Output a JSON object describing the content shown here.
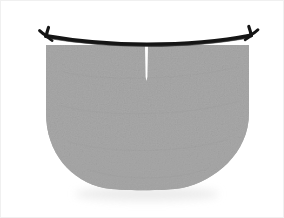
{
  "figure": {
    "title": "Bowl-shaped anatomical structure with dark superior rim",
    "caption": "",
    "canvas": {
      "width": 284,
      "height": 218,
      "background_color": "#ffffff",
      "border_color": "#f0f0f0"
    },
    "colors": {
      "background": "#ffffff",
      "body_fill": "#a8a8a8",
      "body_fill_light": "#b4b4b4",
      "body_fill_dark": "#9c9c9c",
      "rim_stroke": "#151515",
      "slit_fill": "#ffffff",
      "shadow": "#e8e8e8"
    },
    "parts": [
      {
        "id": "body",
        "label": "Bowl-shaped gray body",
        "description": "Large mottled medium-gray region, flat across the top, near-vertical sides, broad rounded U-curve at the bottom",
        "fill": "#a8a8a8",
        "bounds": {
          "left": 45,
          "top": 43,
          "right": 248,
          "bottom": 188
        }
      },
      {
        "id": "rim",
        "label": "Dark superior rim",
        "description": "Thick near-black curved band spanning the top edge, dipping slightly at center and rising toward both ends",
        "stroke": "#151515",
        "thickness": 4,
        "span": {
          "x_start": 42,
          "x_end": 252,
          "y_center": 42,
          "y_ends": 34
        }
      },
      {
        "id": "terminal-left",
        "label": "Left bifurcated terminal hook",
        "description": "Small Y-shaped three-pronged junction at the left end of the rim",
        "position": {
          "x": 45,
          "y": 32
        }
      },
      {
        "id": "terminal-right",
        "label": "Right bifurcated terminal hook",
        "description": "Mirrored Y-shaped three-pronged junction at the right end of the rim",
        "position": {
          "x": 250,
          "y": 32
        }
      },
      {
        "id": "median-slit",
        "label": "Median vertical slit",
        "description": "Thin white vertical notch descending from the rim along the midline",
        "fill": "#ffffff",
        "position": {
          "x": 145,
          "y_top": 45,
          "y_bottom": 80,
          "width": 3
        }
      },
      {
        "id": "ground-shadow",
        "label": "Faint shadow beneath the bowl",
        "description": "Soft light-gray smudge below the lower curve",
        "fill": "#e8e8e8"
      }
    ]
  }
}
